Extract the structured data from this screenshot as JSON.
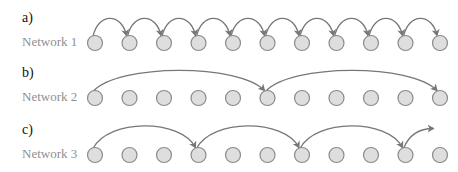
{
  "panels": [
    {
      "letter": "a)",
      "label": "Network 1",
      "row_y": 43,
      "jumps": [
        [
          0,
          1
        ],
        [
          1,
          2
        ],
        [
          2,
          3
        ],
        [
          3,
          4
        ],
        [
          4,
          5
        ],
        [
          5,
          6
        ],
        [
          6,
          7
        ],
        [
          7,
          8
        ],
        [
          8,
          9
        ],
        [
          9,
          10
        ]
      ],
      "arc_height": 24,
      "tail": null
    },
    {
      "letter": "b)",
      "label": "Network 2",
      "row_y": 98,
      "jumps": [
        [
          0,
          5
        ],
        [
          5,
          10
        ]
      ],
      "arc_height": 28,
      "tail": null
    },
    {
      "letter": "c)",
      "label": "Network 3",
      "row_y": 155,
      "jumps": [
        [
          0,
          3
        ],
        [
          3,
          6
        ],
        [
          6,
          9
        ]
      ],
      "arc_height": 30,
      "tail": {
        "from": 9,
        "dx": 30,
        "dy": -20
      }
    }
  ],
  "nodes": {
    "count": 11,
    "x_start": 95,
    "spacing": 34.5,
    "radius": 7.5
  },
  "colors": {
    "node_fill": "#dedede",
    "node_stroke": "#8a8a8a",
    "arrow": "#777777"
  }
}
